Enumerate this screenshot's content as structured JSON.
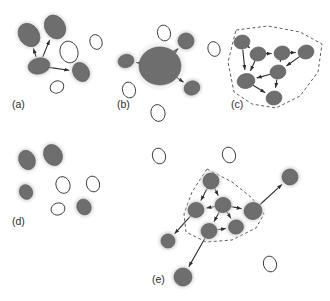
{
  "figure": {
    "width": 330,
    "height": 301,
    "background": "#ffffff"
  },
  "style": {
    "node_fill": "#6e6e6e",
    "node_stroke": "#5a5a5a",
    "halo_fill": "#d0d0d0",
    "halo_opacity": 0.75,
    "empty_fill": "#ffffff",
    "empty_stroke": "#3a3a3a",
    "edge_color": "#2e2e2e",
    "edge_width": 1.1,
    "cluster_boundary_color": "#4a4a4a",
    "cluster_dash": "3,2.5",
    "label_color": "#2b2b2b",
    "label_size": 10.5
  },
  "panels": [
    {
      "id": "a",
      "label": "(a)",
      "label_x": 12,
      "label_y": 108,
      "caption_role": "hub-and-spoke",
      "nodes": [
        {
          "id": "a1",
          "cx": 29,
          "cy": 35,
          "rx": 10,
          "ry": 12.5,
          "rot": -35,
          "filled": true,
          "halo": true
        },
        {
          "id": "a2",
          "cx": 55,
          "cy": 27,
          "rx": 10,
          "ry": 12.5,
          "rot": -30,
          "filled": true,
          "halo": true
        },
        {
          "id": "a3",
          "cx": 39,
          "cy": 66,
          "rx": 11,
          "ry": 8,
          "rot": -12,
          "filled": true,
          "halo": true
        },
        {
          "id": "a4",
          "cx": 81,
          "cy": 72,
          "rx": 8,
          "ry": 10,
          "rot": -30,
          "filled": true,
          "halo": true
        },
        {
          "id": "a5",
          "cx": 69,
          "cy": 52,
          "rx": 9,
          "ry": 11,
          "rot": -15,
          "filled": false,
          "halo": false
        },
        {
          "id": "a6",
          "cx": 96,
          "cy": 42,
          "rx": 6,
          "ry": 7.5,
          "rot": -20,
          "filled": false,
          "halo": false
        },
        {
          "id": "a7",
          "cx": 57,
          "cy": 87,
          "rx": 7,
          "ry": 6,
          "rot": -25,
          "filled": false,
          "halo": false
        }
      ],
      "edges": [
        {
          "from": "a3",
          "to": "a1",
          "arrow": true
        },
        {
          "from": "a3",
          "to": "a2",
          "arrow": true
        },
        {
          "from": "a3",
          "to": "a4",
          "arrow": true
        }
      ],
      "clusters": []
    },
    {
      "id": "b",
      "label": "(b)",
      "label_x": 117,
      "label_y": 108,
      "caption_role": "aggregated supernode",
      "nodes": [
        {
          "id": "b0",
          "cx": 160,
          "cy": 66,
          "rx": 21,
          "ry": 19,
          "rot": 0,
          "filled": true,
          "halo": true,
          "big": true
        },
        {
          "id": "b1",
          "cx": 126,
          "cy": 61,
          "rx": 8,
          "ry": 6.5,
          "rot": -15,
          "filled": true,
          "halo": true
        },
        {
          "id": "b2",
          "cx": 186,
          "cy": 41,
          "rx": 8,
          "ry": 8,
          "rot": -20,
          "filled": true,
          "halo": true
        },
        {
          "id": "b3",
          "cx": 192,
          "cy": 88,
          "rx": 8,
          "ry": 7,
          "rot": -20,
          "filled": true,
          "halo": true
        },
        {
          "id": "b4",
          "cx": 164,
          "cy": 33,
          "rx": 6.5,
          "ry": 8,
          "rot": -15,
          "filled": false,
          "halo": false
        },
        {
          "id": "b5",
          "cx": 129,
          "cy": 90,
          "rx": 6.5,
          "ry": 8,
          "rot": -15,
          "filled": false,
          "halo": false
        },
        {
          "id": "b6",
          "cx": 158,
          "cy": 113,
          "rx": 7,
          "ry": 8.5,
          "rot": -15,
          "filled": false,
          "halo": false
        }
      ],
      "edges": [
        {
          "from": "b0",
          "to": "b1",
          "arrow": true
        },
        {
          "from": "b0",
          "to": "b2",
          "arrow": true
        },
        {
          "from": "b0",
          "to": "b3",
          "arrow": true
        }
      ],
      "clusters": []
    },
    {
      "id": "c",
      "label": "(c)",
      "label_x": 231,
      "label_y": 108,
      "caption_role": "dense bounded cluster",
      "nodes": [
        {
          "id": "c1",
          "cx": 242,
          "cy": 42,
          "rx": 8,
          "ry": 7,
          "rot": -12,
          "filled": true,
          "halo": false
        },
        {
          "id": "c2",
          "cx": 258,
          "cy": 54,
          "rx": 8,
          "ry": 7,
          "rot": -12,
          "filled": true,
          "halo": false
        },
        {
          "id": "c3",
          "cx": 282,
          "cy": 53,
          "rx": 8,
          "ry": 7,
          "rot": -12,
          "filled": true,
          "halo": false
        },
        {
          "id": "c4",
          "cx": 306,
          "cy": 52,
          "rx": 8,
          "ry": 7,
          "rot": -12,
          "filled": true,
          "halo": false
        },
        {
          "id": "c5",
          "cx": 278,
          "cy": 72,
          "rx": 8,
          "ry": 7,
          "rot": -12,
          "filled": true,
          "halo": false
        },
        {
          "id": "c6",
          "cx": 246,
          "cy": 81,
          "rx": 9,
          "ry": 7.5,
          "rot": -12,
          "filled": true,
          "halo": false
        },
        {
          "id": "c7",
          "cx": 274,
          "cy": 98,
          "rx": 8,
          "ry": 7,
          "rot": -12,
          "filled": true,
          "halo": false
        },
        {
          "id": "c8",
          "cx": 214,
          "cy": 49,
          "rx": 6,
          "ry": 7.5,
          "rot": -18,
          "filled": false,
          "halo": false
        }
      ],
      "edges": [
        {
          "from": "c1",
          "to": "c2",
          "arrow": true
        },
        {
          "from": "c1",
          "to": "c6",
          "arrow": true
        },
        {
          "from": "c2",
          "to": "c3",
          "arrow": true
        },
        {
          "from": "c2",
          "to": "c6",
          "arrow": true
        },
        {
          "from": "c3",
          "to": "c4",
          "arrow": true
        },
        {
          "from": "c3",
          "to": "c5",
          "arrow": true
        },
        {
          "from": "c4",
          "to": "c5",
          "arrow": true
        },
        {
          "from": "c5",
          "to": "c6",
          "arrow": true
        },
        {
          "from": "c5",
          "to": "c7",
          "arrow": true
        },
        {
          "from": "c6",
          "to": "c7",
          "arrow": true
        }
      ],
      "clusters": [
        {
          "id": "cluster-c",
          "points": "236,30 268,26 300,32 322,44 318,72 300,96 276,108 252,104 234,92 228,62"
        }
      ]
    },
    {
      "id": "d",
      "label": "(d)",
      "label_x": 12,
      "label_y": 225,
      "caption_role": "isolated nodes",
      "nodes": [
        {
          "id": "d1",
          "cx": 27,
          "cy": 160,
          "rx": 8,
          "ry": 10,
          "rot": -25,
          "filled": true,
          "halo": true
        },
        {
          "id": "d2",
          "cx": 53,
          "cy": 155,
          "rx": 9,
          "ry": 11,
          "rot": -28,
          "filled": true,
          "halo": true
        },
        {
          "id": "d3",
          "cx": 26,
          "cy": 192,
          "rx": 6.5,
          "ry": 7.5,
          "rot": -25,
          "filled": true,
          "halo": true
        },
        {
          "id": "d4",
          "cx": 84,
          "cy": 207,
          "rx": 7,
          "ry": 8,
          "rot": -25,
          "filled": true,
          "halo": true
        },
        {
          "id": "d5",
          "cx": 63,
          "cy": 185,
          "rx": 7,
          "ry": 8.5,
          "rot": -18,
          "filled": false,
          "halo": false
        },
        {
          "id": "d6",
          "cx": 93,
          "cy": 184,
          "rx": 6.5,
          "ry": 8,
          "rot": -18,
          "filled": false,
          "halo": false
        },
        {
          "id": "d7",
          "cx": 58,
          "cy": 209,
          "rx": 7,
          "ry": 6,
          "rot": -18,
          "filled": false,
          "halo": false
        }
      ],
      "edges": [],
      "clusters": []
    },
    {
      "id": "e",
      "label": "(e)",
      "label_x": 152,
      "label_y": 283,
      "caption_role": "cluster with external links",
      "nodes": [
        {
          "id": "e1",
          "cx": 211,
          "cy": 181,
          "rx": 8,
          "ry": 8,
          "rot": -15,
          "filled": true,
          "halo": true
        },
        {
          "id": "e2",
          "cx": 223,
          "cy": 205,
          "rx": 8,
          "ry": 7.5,
          "rot": -15,
          "filled": true,
          "halo": true
        },
        {
          "id": "e3",
          "cx": 196,
          "cy": 210,
          "rx": 8,
          "ry": 7.5,
          "rot": -15,
          "filled": true,
          "halo": true
        },
        {
          "id": "e4",
          "cx": 253,
          "cy": 211,
          "rx": 9,
          "ry": 8.5,
          "rot": -15,
          "filled": true,
          "halo": true
        },
        {
          "id": "e5",
          "cx": 209,
          "cy": 231,
          "rx": 8,
          "ry": 7.5,
          "rot": -15,
          "filled": true,
          "halo": true
        },
        {
          "id": "e6",
          "cx": 236,
          "cy": 227,
          "rx": 7.5,
          "ry": 7,
          "rot": -15,
          "filled": true,
          "halo": true
        },
        {
          "id": "e7",
          "cx": 168,
          "cy": 241,
          "rx": 7,
          "ry": 7,
          "rot": -15,
          "filled": true,
          "halo": true
        },
        {
          "id": "e8",
          "cx": 183,
          "cy": 277,
          "rx": 9,
          "ry": 9,
          "rot": -15,
          "filled": true,
          "halo": true
        },
        {
          "id": "e9",
          "cx": 290,
          "cy": 177,
          "rx": 8,
          "ry": 8,
          "rot": -15,
          "filled": true,
          "halo": true
        },
        {
          "id": "e10",
          "cx": 159,
          "cy": 156,
          "rx": 6.5,
          "ry": 8,
          "rot": -18,
          "filled": false,
          "halo": false
        },
        {
          "id": "e11",
          "cx": 229,
          "cy": 155,
          "rx": 6.5,
          "ry": 8,
          "rot": -18,
          "filled": false,
          "halo": false
        },
        {
          "id": "e12",
          "cx": 270,
          "cy": 264,
          "rx": 6.5,
          "ry": 8,
          "rot": -18,
          "filled": false,
          "halo": false
        }
      ],
      "edges": [
        {
          "from": "e1",
          "to": "e2",
          "arrow": true
        },
        {
          "from": "e1",
          "to": "e3",
          "arrow": true
        },
        {
          "from": "e2",
          "to": "e3",
          "arrow": true
        },
        {
          "from": "e2",
          "to": "e4",
          "arrow": true
        },
        {
          "from": "e2",
          "to": "e5",
          "arrow": true
        },
        {
          "from": "e2",
          "to": "e6",
          "arrow": true
        },
        {
          "from": "e5",
          "to": "e6",
          "arrow": true
        },
        {
          "from": "e3",
          "to": "e7",
          "arrow": true
        },
        {
          "from": "e5",
          "to": "e8",
          "arrow": true
        },
        {
          "from": "e4",
          "to": "e9",
          "arrow": true
        }
      ],
      "clusters": [
        {
          "id": "cluster-e",
          "points": "207,169 232,182 252,198 264,214 256,228 232,240 206,242 186,232 184,214 192,192"
        }
      ]
    }
  ]
}
